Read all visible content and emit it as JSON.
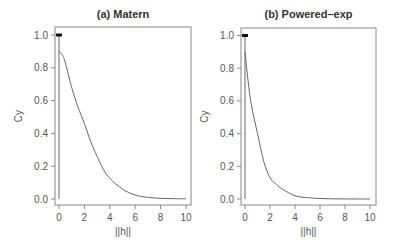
{
  "chart_data": [
    {
      "type": "line",
      "title": "(a) Matern",
      "xlabel": "||h||",
      "ylabel": "Cy",
      "xlim": [
        0,
        10
      ],
      "ylim": [
        0,
        1
      ],
      "xticks": [
        0,
        2,
        4,
        6,
        8,
        10
      ],
      "yticks": [
        "0.0",
        "0.2",
        "0.4",
        "0.6",
        "0.8",
        "1.0"
      ],
      "grid": false,
      "points": [
        {
          "x": 0,
          "y": 1.0,
          "marker": "filled"
        }
      ],
      "series": [
        {
          "name": "Matern covariance",
          "x": [
            0,
            0.25,
            0.5,
            1,
            1.5,
            2,
            2.5,
            3,
            3.5,
            4,
            5,
            6,
            7,
            8,
            9,
            10
          ],
          "y": [
            0.9,
            0.88,
            0.83,
            0.68,
            0.56,
            0.46,
            0.35,
            0.26,
            0.18,
            0.126,
            0.06,
            0.024,
            0.01,
            0.004,
            0.002,
            0.001
          ]
        }
      ]
    },
    {
      "type": "line",
      "title": "(b) Powered–exp",
      "xlabel": "||h||",
      "ylabel": "Cy",
      "xlim": [
        0,
        10
      ],
      "ylim": [
        0,
        1
      ],
      "xticks": [
        0,
        2,
        4,
        6,
        8,
        10
      ],
      "yticks": [
        "0.0",
        "0.2",
        "0.4",
        "0.6",
        "0.8",
        "1.0"
      ],
      "grid": false,
      "points": [
        {
          "x": 0,
          "y": 1.0,
          "marker": "filled"
        }
      ],
      "series": [
        {
          "name": "Powered-exponential covariance",
          "x": [
            0,
            0.25,
            0.5,
            1,
            1.5,
            2,
            2.5,
            3,
            4,
            5,
            6,
            7,
            8,
            9,
            10
          ],
          "y": [
            0.9,
            0.72,
            0.58,
            0.4,
            0.23,
            0.13,
            0.09,
            0.06,
            0.02,
            0.008,
            0.003,
            0.001,
            0.0005,
            0.0002,
            0.0001
          ]
        }
      ]
    }
  ]
}
